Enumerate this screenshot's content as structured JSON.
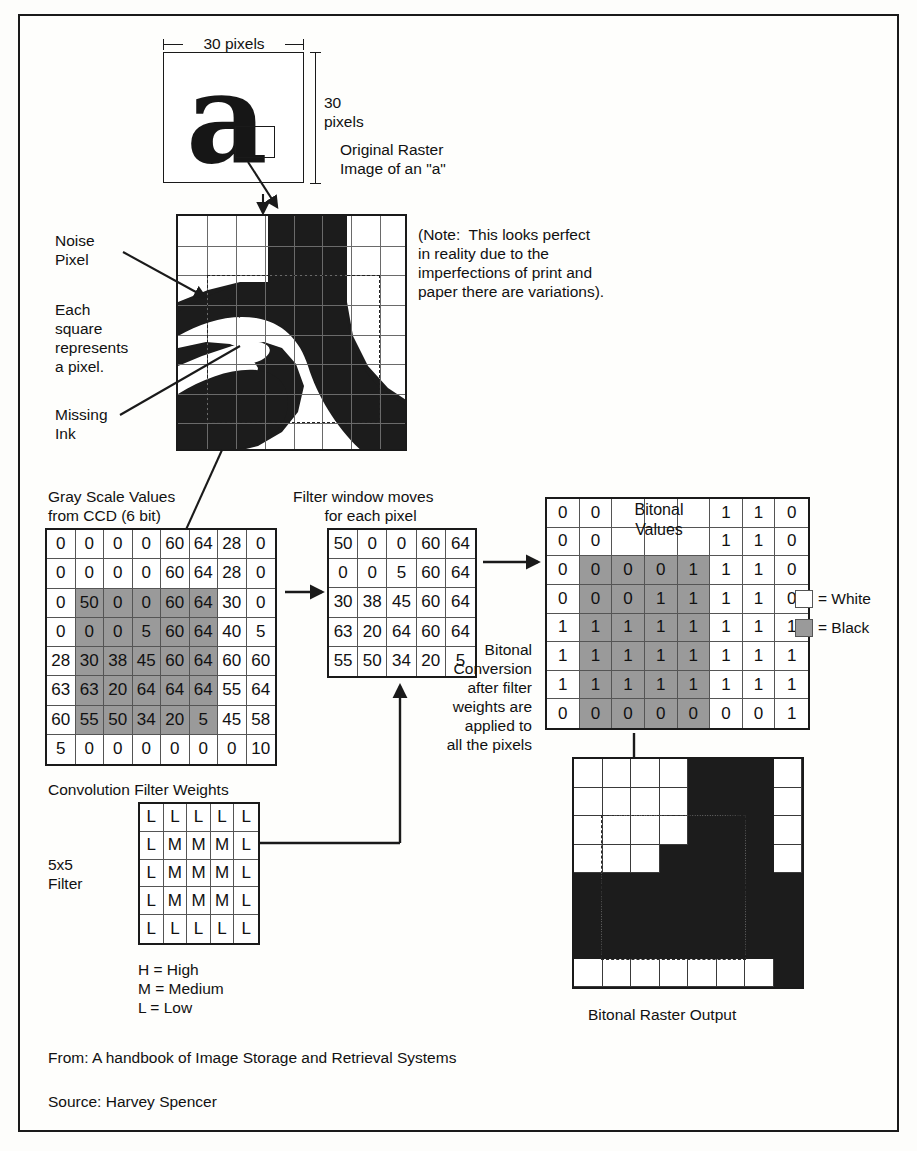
{
  "figure": {
    "caption_from": "From: A handbook of Image Storage and Retrieval Systems",
    "caption_source": "Source: Harvey Spencer"
  },
  "original_raster": {
    "width_label": "30 pixels",
    "height_label_line1": "30",
    "height_label_line2": "pixels",
    "glyph": "a",
    "caption_line1": "Original Raster",
    "caption_line2": "Image of an \"a\""
  },
  "magnified": {
    "note_line1": "(Note:  This looks perfect",
    "note_line2": "in reality due to the",
    "note_line3": "imperfections of print and",
    "note_line4": "paper there are variations).",
    "label_noise_line1": "Noise",
    "label_noise_line2": "Pixel",
    "label_each_line1": "Each",
    "label_each_line2": "square",
    "label_each_line3": "represents",
    "label_each_line4": "a pixel.",
    "label_missing_line1": "Missing",
    "label_missing_line2": "Ink"
  },
  "gray_scale": {
    "title_line1": "Gray Scale Values",
    "title_line2": "from CCD (6 bit)",
    "rows": [
      [
        "0",
        "0",
        "0",
        "0",
        "60",
        "64",
        "28",
        "0"
      ],
      [
        "0",
        "0",
        "0",
        "0",
        "60",
        "64",
        "28",
        "0"
      ],
      [
        "0",
        "50",
        "0",
        "0",
        "60",
        "64",
        "30",
        "0"
      ],
      [
        "0",
        "0",
        "0",
        "5",
        "60",
        "64",
        "40",
        "5"
      ],
      [
        "28",
        "30",
        "38",
        "45",
        "60",
        "64",
        "60",
        "60"
      ],
      [
        "63",
        "63",
        "20",
        "64",
        "64",
        "64",
        "55",
        "64"
      ],
      [
        "60",
        "55",
        "50",
        "34",
        "20",
        "5",
        "45",
        "58"
      ],
      [
        "5",
        "0",
        "0",
        "0",
        "0",
        "0",
        "0",
        "10"
      ]
    ],
    "shaded_region": {
      "row_start": 2,
      "row_end": 6,
      "col_start": 1,
      "col_end": 5
    }
  },
  "filter_window": {
    "title_line1": "Filter window moves",
    "title_line2": "for each pixel",
    "rows": [
      [
        "50",
        "0",
        "0",
        "60",
        "64"
      ],
      [
        "0",
        "0",
        "5",
        "60",
        "64"
      ],
      [
        "30",
        "38",
        "45",
        "60",
        "64"
      ],
      [
        "63",
        "20",
        "64",
        "60",
        "64"
      ],
      [
        "55",
        "50",
        "34",
        "20",
        "5"
      ]
    ]
  },
  "bitonal_values": {
    "title_line1": "Bitonal",
    "title_line2": "Values",
    "rows": [
      [
        "0",
        "0",
        "",
        "",
        "",
        "1",
        "1",
        "0"
      ],
      [
        "0",
        "0",
        "",
        "",
        "",
        "1",
        "1",
        "0"
      ],
      [
        "0",
        "0",
        "0",
        "0",
        "1",
        "1",
        "1",
        "0"
      ],
      [
        "0",
        "0",
        "0",
        "1",
        "1",
        "1",
        "1",
        "0"
      ],
      [
        "1",
        "1",
        "1",
        "1",
        "1",
        "1",
        "1",
        "1"
      ],
      [
        "1",
        "1",
        "1",
        "1",
        "1",
        "1",
        "1",
        "1"
      ],
      [
        "1",
        "1",
        "1",
        "1",
        "1",
        "1",
        "1",
        "1"
      ],
      [
        "0",
        "0",
        "0",
        "0",
        "0",
        "0",
        "0",
        "1"
      ]
    ],
    "shaded_region": {
      "row_start": 2,
      "row_end": 7,
      "col_start": 1,
      "col_end": 4
    },
    "legend_white": "= White",
    "legend_black": "= Black"
  },
  "conversion_note": {
    "line1": "Bitonal",
    "line2": "Conversion",
    "line3": "after filter",
    "line4": "weights are",
    "line5": "applied to",
    "line6": "all the pixels"
  },
  "convolution_filter": {
    "title": "Convolution Filter Weights",
    "side_label_line1": "5x5",
    "side_label_line2": "Filter",
    "rows": [
      [
        "L",
        "L",
        "L",
        "L",
        "L"
      ],
      [
        "L",
        "M",
        "M",
        "M",
        "L"
      ],
      [
        "L",
        "M",
        "M",
        "M",
        "L"
      ],
      [
        "L",
        "M",
        "M",
        "M",
        "L"
      ],
      [
        "L",
        "L",
        "L",
        "L",
        "L"
      ]
    ],
    "legend": [
      "H = High",
      "M = Medium",
      "L = Low"
    ]
  },
  "bitonal_output": {
    "caption": "Bitonal Raster Output",
    "rows": [
      [
        0,
        0,
        0,
        0,
        1,
        1,
        1,
        0
      ],
      [
        0,
        0,
        0,
        0,
        1,
        1,
        1,
        0
      ],
      [
        0,
        0,
        0,
        0,
        1,
        1,
        1,
        0
      ],
      [
        0,
        0,
        0,
        1,
        1,
        1,
        1,
        0
      ],
      [
        1,
        1,
        1,
        1,
        1,
        1,
        1,
        1
      ],
      [
        1,
        1,
        1,
        1,
        1,
        1,
        1,
        1
      ],
      [
        1,
        1,
        1,
        1,
        1,
        1,
        1,
        1
      ],
      [
        0,
        0,
        0,
        0,
        0,
        0,
        0,
        1
      ]
    ]
  },
  "colors": {
    "ink": "#1c1c1c",
    "shade": "#9a9a9a",
    "paper": "#fefefc",
    "gridline": "#6a6a6a"
  }
}
